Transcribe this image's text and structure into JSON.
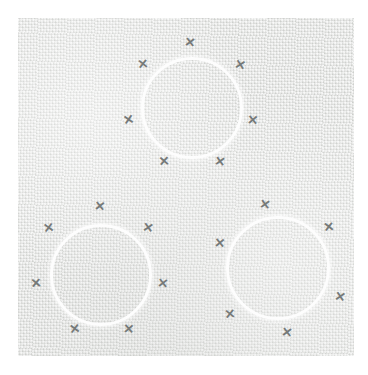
{
  "artwork": {
    "title": "Three Circles With X Marks",
    "description": "Abstract composition: three white ring outlines arranged in a triangle on a textured light-grey paper panel, each ring encircled by six small grey x marks.",
    "canvas": {
      "width": 368,
      "height": 375,
      "background_color": "#ffffff"
    },
    "panel": {
      "name": "textured-paper-panel",
      "x": 18,
      "y": 18,
      "width": 336,
      "height": 338,
      "base_color": "#e3e4e2",
      "texture": "woven-canvas-paper"
    },
    "colors": {
      "page_background": "#ffffff",
      "panel_base": "#e3e4e2",
      "ring_stroke": "#fdfdfd",
      "x_mark": "#767a79"
    },
    "circles": [
      {
        "id": "circle-top",
        "label": "Top circle",
        "cx": 192,
        "cy": 108,
        "radius": 51,
        "stroke_width": 3,
        "stroke_color": "#fdfdfd",
        "marks": [
          {
            "id": "x-top-1",
            "cx": 190,
            "cy": 42,
            "size": 13,
            "rotation": 8
          },
          {
            "id": "x-top-2",
            "cx": 142,
            "cy": 63,
            "size": 13,
            "rotation": -6
          },
          {
            "id": "x-top-3",
            "cx": 240,
            "cy": 64,
            "size": 13,
            "rotation": 12
          },
          {
            "id": "x-top-4",
            "cx": 128,
            "cy": 119,
            "size": 13,
            "rotation": -10
          },
          {
            "id": "x-top-5",
            "cx": 252,
            "cy": 119,
            "size": 13,
            "rotation": 5
          },
          {
            "id": "x-top-6",
            "cx": 164,
            "cy": 161,
            "size": 13,
            "rotation": -4
          },
          {
            "id": "x-top-7",
            "cx": 220,
            "cy": 161,
            "size": 13,
            "rotation": 9
          }
        ]
      },
      {
        "id": "circle-bottom-left",
        "label": "Bottom-left circle",
        "cx": 101,
        "cy": 275,
        "radius": 51,
        "stroke_width": 3,
        "stroke_color": "#fdfdfd",
        "marks": [
          {
            "id": "x-bl-1",
            "cx": 99,
            "cy": 206,
            "size": 13,
            "rotation": 6
          },
          {
            "id": "x-bl-2",
            "cx": 48,
            "cy": 227,
            "size": 13,
            "rotation": -9
          },
          {
            "id": "x-bl-3",
            "cx": 148,
            "cy": 227,
            "size": 13,
            "rotation": 10
          },
          {
            "id": "x-bl-4",
            "cx": 36,
            "cy": 283,
            "size": 13,
            "rotation": -5
          },
          {
            "id": "x-bl-5",
            "cx": 163,
            "cy": 283,
            "size": 13,
            "rotation": 7
          },
          {
            "id": "x-bl-6",
            "cx": 74,
            "cy": 328,
            "size": 13,
            "rotation": -8
          },
          {
            "id": "x-bl-7",
            "cx": 128,
            "cy": 328,
            "size": 13,
            "rotation": 4
          }
        ]
      },
      {
        "id": "circle-bottom-right",
        "label": "Bottom-right circle",
        "cx": 278,
        "cy": 268,
        "radius": 52,
        "stroke_width": 3,
        "stroke_color": "#fdfdfd",
        "marks": [
          {
            "id": "x-br-1",
            "cx": 265,
            "cy": 204,
            "size": 13,
            "rotation": 9
          },
          {
            "id": "x-br-2",
            "cx": 328,
            "cy": 226,
            "size": 13,
            "rotation": -7
          },
          {
            "id": "x-br-3",
            "cx": 219,
            "cy": 242,
            "size": 13,
            "rotation": 5
          },
          {
            "id": "x-br-4",
            "cx": 340,
            "cy": 296,
            "size": 13,
            "rotation": 11
          },
          {
            "id": "x-br-5",
            "cx": 229,
            "cy": 313,
            "size": 13,
            "rotation": -6
          },
          {
            "id": "x-br-6",
            "cx": 287,
            "cy": 332,
            "size": 13,
            "rotation": 8
          }
        ]
      }
    ]
  }
}
